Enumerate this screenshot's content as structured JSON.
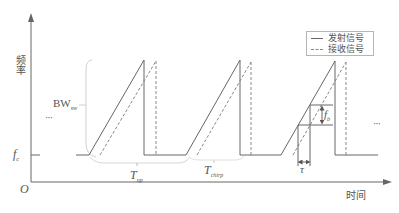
{
  "diagram": {
    "type": "FMCW sawtooth chirp timing diagram",
    "y_axis_label": "频率",
    "x_axis_label": "时间",
    "origin_label": "O",
    "baseline_label": {
      "main": "f",
      "sub": "c"
    },
    "bandwidth_label": {
      "main": "BW",
      "sub": "sw"
    },
    "ramp_period_label": {
      "main": "T",
      "sub": "up"
    },
    "chirp_period_label": {
      "main": "T",
      "sub": "chirp"
    },
    "delay_label": "τ",
    "beat_freq_label": {
      "main": "f",
      "sub": "b"
    },
    "ellipsis_left": "···",
    "ellipsis_right": "···",
    "legend": {
      "items": [
        {
          "label": "发射信号",
          "style": "solid"
        },
        {
          "label": "接收信号",
          "style": "dashed"
        }
      ]
    },
    "colors": {
      "line": "#666666",
      "dashed": "#888888",
      "brace": "#c8c8c8",
      "text": "#555555"
    },
    "chirps": [
      {
        "tx_start_x": 89,
        "tx_peak_x": 144,
        "rx_start_x": 100,
        "rx_peak_x": 156
      },
      {
        "tx_start_x": 186,
        "tx_peak_x": 240,
        "rx_start_x": 197,
        "rx_peak_x": 251
      },
      {
        "tx_start_x": 281,
        "tx_peak_x": 335,
        "rx_start_x": 293,
        "rx_peak_x": 346
      }
    ]
  }
}
